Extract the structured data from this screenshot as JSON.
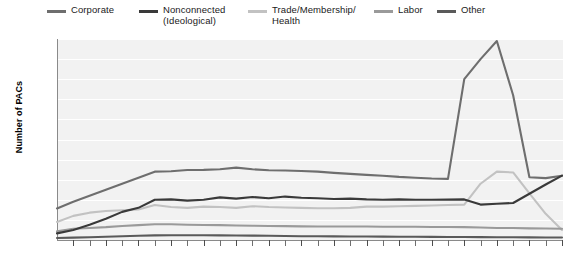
{
  "chart_data": {
    "type": "line",
    "title": "",
    "xlabel": "",
    "ylabel": "Number of PACs",
    "xlim": [
      1978,
      2009
    ],
    "ylim": [
      0,
      5000
    ],
    "ytick_step": 500,
    "grid": true,
    "legend_position": "top",
    "x": [
      1978,
      1979,
      1980,
      1981,
      1982,
      1983,
      1984,
      1985,
      1986,
      1987,
      1988,
      1989,
      1990,
      1991,
      1992,
      1993,
      1994,
      1995,
      1996,
      1997,
      1998,
      1999,
      2000,
      2001,
      2002,
      2003,
      2004,
      2005,
      2006,
      2007,
      2008,
      2009
    ],
    "yticks": [
      500,
      1000,
      1500,
      2000,
      2500,
      3000,
      3500,
      4000,
      4500,
      5000
    ],
    "ytick_labels": [
      "500",
      "1,000",
      "1,500",
      "2,000",
      "2,500",
      "3,000",
      "3,500",
      "4,000",
      "4,500",
      "5,000"
    ],
    "xtick_labels": [
      "1979",
      "1981",
      "1983",
      "1985",
      "1987",
      "1989",
      "1991",
      "1993",
      "1995",
      "1997",
      "1999",
      "2001",
      "2003",
      "2005",
      "2007",
      "2009"
    ],
    "xticks": [
      1979,
      1981,
      1983,
      1985,
      1987,
      1989,
      1991,
      1993,
      1995,
      1997,
      1999,
      2001,
      2003,
      2005,
      2007,
      2009
    ],
    "series": [
      {
        "name": "Corporate",
        "color": "#6e6e6e",
        "values": [
          785,
          950,
          1100,
          1250,
          1400,
          1550,
          1700,
          1710,
          1740,
          1745,
          1760,
          1800,
          1760,
          1735,
          1730,
          1715,
          1700,
          1670,
          1645,
          1620,
          1600,
          1570,
          1550,
          1530,
          1520,
          4000,
          4500,
          4950,
          3600,
          1560,
          1540,
          1600
        ]
      },
      {
        "name": "Nonconnected (Ideological)",
        "color": "#3a3a3a",
        "values": [
          165,
          250,
          380,
          530,
          700,
          800,
          1000,
          1010,
          980,
          1000,
          1060,
          1030,
          1070,
          1040,
          1080,
          1050,
          1040,
          1020,
          1030,
          1010,
          1000,
          1010,
          1000,
          1000,
          1005,
          1010,
          880,
          900,
          920,
          1150,
          1380,
          1600
        ]
      },
      {
        "name": "Trade/Membership/Health",
        "color": "#c2c2c2",
        "values": [
          450,
          600,
          680,
          720,
          740,
          760,
          870,
          820,
          800,
          830,
          820,
          800,
          840,
          820,
          810,
          800,
          790,
          790,
          800,
          830,
          830,
          840,
          850,
          860,
          870,
          880,
          1400,
          1700,
          1680,
          1160,
          650,
          250
        ]
      },
      {
        "name": "Labor",
        "color": "#9a9a9a",
        "values": [
          215,
          280,
          300,
          320,
          350,
          370,
          390,
          390,
          380,
          375,
          370,
          360,
          355,
          350,
          345,
          340,
          335,
          335,
          335,
          335,
          330,
          330,
          330,
          325,
          325,
          320,
          310,
          300,
          300,
          290,
          285,
          280
        ]
      },
      {
        "name": "Other",
        "color": "#5a5a5a",
        "values": [
          50,
          60,
          70,
          80,
          95,
          105,
          115,
          120,
          120,
          118,
          115,
          112,
          110,
          105,
          100,
          95,
          92,
          90,
          88,
          86,
          84,
          82,
          80,
          78,
          76,
          74,
          72,
          70,
          68,
          66,
          64,
          62
        ]
      }
    ]
  },
  "legend": {
    "items": [
      {
        "label": "Corporate",
        "color": "#6e6e6e",
        "left": 47,
        "swatch": "legend-line-corporate"
      },
      {
        "label": "Nonconnected\n(Ideological)",
        "color": "#3a3a3a",
        "left": 139,
        "swatch": "legend-line-nonconnected"
      },
      {
        "label": "Trade/Membership/\nHealth",
        "color": "#c2c2c2",
        "left": 248,
        "swatch": "legend-line-trade"
      },
      {
        "label": "Labor",
        "color": "#9a9a9a",
        "left": 374,
        "swatch": "legend-line-labor"
      },
      {
        "label": "Other",
        "color": "#5a5a5a",
        "left": 437,
        "swatch": "legend-line-other"
      }
    ]
  },
  "axes": {
    "y_title": "Number of PACs"
  },
  "colors": {
    "plot_background": "#f2f2f2",
    "gridline": "#ffffff",
    "axis_line": "#8a8a8a",
    "text": "#1a1a1a"
  }
}
